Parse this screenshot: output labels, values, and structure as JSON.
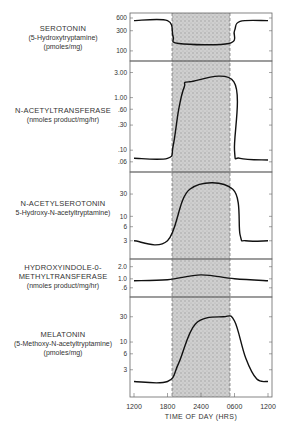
{
  "chart_data": {
    "type": "line",
    "title": "",
    "xlabel": "TIME OF DAY (HRS)",
    "x_ticks": [
      "1200",
      "1800",
      "2400",
      "0600",
      "1200"
    ],
    "dark_period": {
      "start": "1800",
      "end": "0600",
      "shaded": true
    },
    "panels": [
      {
        "id": "serotonin",
        "title": "SEROTONIN",
        "subtitle": "(5-Hydroxytryptamine)",
        "unit": "(pmoles/mg)",
        "scale": "log",
        "y_ticks": [
          "600",
          "300",
          "100"
        ],
        "ylim": [
          80,
          600
        ],
        "series": [
          {
            "name": "Serotonin",
            "x_hours": [
              0,
              6,
              7,
              8,
              17,
              18,
              19,
              24
            ],
            "values": [
              520,
              520,
              220,
              150,
              150,
              300,
              500,
              520
            ]
          }
        ]
      },
      {
        "id": "nat",
        "title": "N-ACETYLTRANSFERASE",
        "subtitle": "(nmoles product/mg/hr)",
        "unit": "",
        "scale": "log",
        "y_ticks": [
          "3.00",
          "1.00",
          ".60",
          ".30",
          ".10",
          ".06"
        ],
        "ylim": [
          0.05,
          3.5
        ],
        "series": [
          {
            "name": "N-Acetyltransferase",
            "x_hours": [
              0,
              6,
              7,
              8,
              9,
              10,
              17.9,
              18,
              19,
              24
            ],
            "values": [
              0.07,
              0.07,
              0.12,
              0.6,
              1.6,
              2.0,
              2.0,
              0.1,
              0.07,
              0.065
            ]
          }
        ]
      },
      {
        "id": "nas",
        "title": "N-ACETYLSEROTONIN",
        "subtitle": "5-Hydroxy-N-acetyltryptamine)",
        "unit": "",
        "scale": "log",
        "y_ticks": [
          "30",
          "10",
          "6",
          "3"
        ],
        "ylim": [
          2,
          60
        ],
        "series": [
          {
            "name": "N-Acetylserotonin",
            "x_hours": [
              0,
              6,
              10,
              17.7,
              19,
              20,
              24
            ],
            "values": [
              3,
              3,
              38,
              38,
              4,
              3,
              3
            ]
          }
        ]
      },
      {
        "id": "hiomt",
        "title": "HYDROXYINDOLE-0-",
        "subtitle": "METHYLTRANSFERASE",
        "unit": "(nmoles product/mg/hr)",
        "scale": "log",
        "y_ticks": [
          "2.0",
          "1.0",
          ".6"
        ],
        "ylim": [
          0.5,
          2.2
        ],
        "series": [
          {
            "name": "HIOMT",
            "x_hours": [
              0,
              6,
              12,
              18,
              24
            ],
            "values": [
              0.9,
              0.95,
              1.25,
              1.0,
              0.9
            ]
          }
        ]
      },
      {
        "id": "melatonin",
        "title": "MELATONIN",
        "subtitle": "(5-Methoxy-N-acetyltryptamine)",
        "unit": "(pmoles/mg)",
        "scale": "log",
        "y_ticks": [
          "30",
          "10",
          "6",
          "3"
        ],
        "ylim": [
          1.3,
          50
        ],
        "series": [
          {
            "name": "Melatonin",
            "x_hours": [
              0,
              6,
              8,
              11,
              16,
              18,
              20,
              22,
              24
            ],
            "values": [
              1.8,
              1.8,
              4,
              22,
              30,
              25,
              5,
              2,
              1.8
            ]
          }
        ]
      }
    ]
  },
  "labels": {
    "p1": {
      "title": "SEROTONIN",
      "sub": "(5-Hydroxytryptamine)",
      "unit": "(pmoles/mg)"
    },
    "p2": {
      "title": "N-ACETYLTRANSFERASE",
      "sub": "(nmoles product/mg/hr)"
    },
    "p3": {
      "title": "N-ACETYLSEROTONIN",
      "sub": "5-Hydroxy-N-acetyltryptamine)"
    },
    "p4": {
      "title": "HYDROXYINDOLE-0-",
      "sub": "METHYLTRANSFERASE",
      "unit": "(nmoles product/mg/hr)"
    },
    "p5": {
      "title": "MELATONIN",
      "sub": "(5-Methoxy-N-acetyltryptamine)",
      "unit": "(pmoles/mg)"
    }
  },
  "x_axis_title": "TIME OF DAY (HRS)"
}
